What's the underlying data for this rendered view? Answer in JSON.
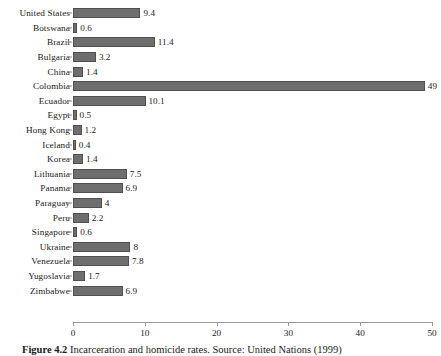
{
  "figure": {
    "caption_label": "Figure 4.2",
    "caption_text": "Incarceration and homicide rates. Source: United Nations (1999)"
  },
  "chart_data": {
    "type": "bar",
    "orientation": "horizontal",
    "title": "",
    "xlabel": "",
    "ylabel": "",
    "xlim": [
      0,
      50
    ],
    "xticks": [
      0,
      10,
      20,
      30,
      40,
      50
    ],
    "xtick_labels": [
      "0",
      "10",
      "20",
      "30",
      "40",
      "50"
    ],
    "grid": false,
    "legend": null,
    "bar_color": "#6e6e6e",
    "bar_edge_color": "#4f4f4f",
    "axis_color": "#9a9a9a",
    "categories": [
      "United States",
      "Botswana",
      "Brazil",
      "Bulgaria",
      "China",
      "Colombia",
      "Ecuador",
      "Egypt",
      "Hong Kong",
      "Iceland",
      "Korea",
      "Lithuania",
      "Panama",
      "Paraguay",
      "Peru",
      "Singapore",
      "Ukraine",
      "Venezuela",
      "Yugoslavia",
      "Zimbabwe"
    ],
    "values": [
      9.4,
      0.6,
      11.4,
      3.2,
      1.4,
      49,
      10.1,
      0.5,
      1.2,
      0.4,
      1.4,
      7.5,
      6.9,
      4,
      2.2,
      0.6,
      8,
      7.8,
      1.7,
      6.9
    ],
    "value_labels": [
      "9.4",
      "0.6",
      "11.4",
      "3.2",
      "1.4",
      "49",
      "10.1",
      "0.5",
      "1.2",
      "0.4",
      "1.4",
      "7.5",
      "6.9",
      "4",
      "2.2",
      "0.6",
      "8",
      "7.8",
      "1.7",
      "6.9"
    ]
  }
}
